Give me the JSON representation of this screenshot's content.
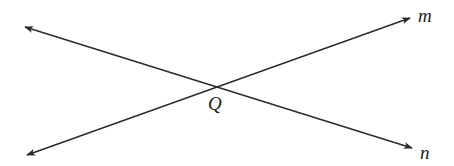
{
  "diagram": {
    "type": "intersecting-lines",
    "background": "#ffffff",
    "stroke_color": "#2a2a2a",
    "lines": [
      {
        "name": "m",
        "label": "m",
        "from": [
          27,
          155
        ],
        "to": [
          410,
          18
        ],
        "arrows": "both"
      },
      {
        "name": "n",
        "label": "n",
        "from": [
          25,
          27
        ],
        "to": [
          412,
          148
        ],
        "arrows": "both"
      }
    ],
    "intersection": {
      "label": "Q",
      "point": [
        217,
        86
      ]
    },
    "labels": {
      "m": "m",
      "n": "n",
      "q": "Q"
    }
  }
}
